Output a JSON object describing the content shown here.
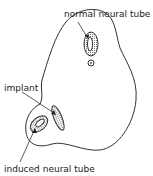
{
  "diagram": {
    "type": "embryo cross-section diagram",
    "labels": {
      "normal": "normal neural tube",
      "implant": "implant",
      "induced": "induced neural tube"
    },
    "parts": [
      {
        "id": "embryo-outline",
        "description": "outline of embryo"
      },
      {
        "id": "normal-neural-tube",
        "description": "stippled oval with lumen, upper center"
      },
      {
        "id": "notochord",
        "description": "small circle below normal neural tube"
      },
      {
        "id": "implant",
        "description": "elongated stippled implant on left side"
      },
      {
        "id": "induced-neural-tube",
        "description": "stippled oval in left lobe"
      }
    ],
    "colors": {
      "line": "#333333",
      "stipple": "#888888",
      "background": "#ffffff"
    }
  }
}
